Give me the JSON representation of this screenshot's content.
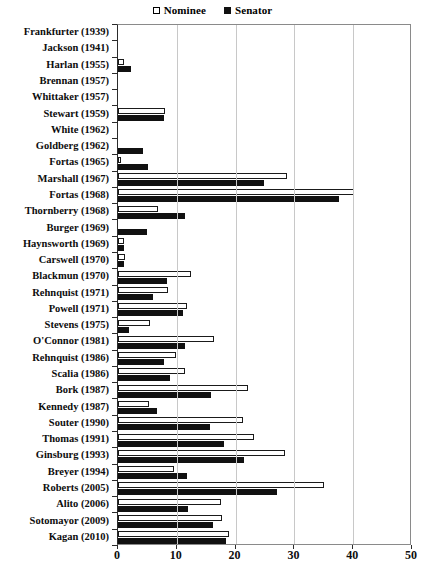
{
  "legend": {
    "position": "top-center",
    "entries": [
      {
        "label": "Nominee",
        "marker": "open-square-icon",
        "color": "#ffffff"
      },
      {
        "label": "Senator",
        "marker": "filled-square-icon",
        "color": "#111111"
      }
    ]
  },
  "chart_data": {
    "type": "bar",
    "orientation": "horizontal",
    "title": "",
    "subtitle": "",
    "xlabel": "",
    "ylabel": "",
    "xlim": [
      0,
      50
    ],
    "xticks": [
      0,
      10,
      20,
      30,
      40,
      50
    ],
    "xtick_labels": [
      "0",
      "10",
      "20",
      "30",
      "40",
      "50"
    ],
    "grid": "vertical",
    "legend_entries": [
      "Nominee",
      "Senator"
    ],
    "categories": [
      "Frankfurter (1939)",
      "Jackson (1941)",
      "Harlan (1955)",
      "Brennan (1957)",
      "Whittaker (1957)",
      "Stewart (1959)",
      "White (1962)",
      "Goldberg (1962)",
      "Fortas (1965)",
      "Marshall (1967)",
      "Fortas (1968)",
      "Thornberry (1968)",
      "Burger (1969)",
      "Haynsworth (1969)",
      "Carswell (1970)",
      "Blackmun (1970)",
      "Rehnquist (1971)",
      "Powell (1971)",
      "Stevens (1975)",
      "O'Connor (1981)",
      "Rehnquist (1986)",
      "Scalia (1986)",
      "Bork (1987)",
      "Kennedy (1987)",
      "Souter (1990)",
      "Thomas (1991)",
      "Ginsburg (1993)",
      "Breyer (1994)",
      "Roberts (2005)",
      "Alito (2006)",
      "Sotomayor (2009)",
      "Kagan (2010)"
    ],
    "series": [
      {
        "name": "Nominee",
        "style": "open",
        "values": [
          0,
          0,
          1.0,
          0,
          0,
          8.0,
          0,
          0,
          0.5,
          28.7,
          40.1,
          6.8,
          0,
          1.0,
          1.2,
          12.4,
          8.5,
          11.7,
          5.4,
          16.3,
          9.9,
          11.4,
          22.1,
          5.2,
          21.3,
          23.1,
          28.4,
          9.6,
          35.0,
          17.5,
          17.7,
          18.9
        ]
      },
      {
        "name": "Senator",
        "style": "filled",
        "values": [
          0,
          0,
          2.2,
          0,
          0,
          7.8,
          0,
          4.3,
          5.1,
          24.8,
          37.6,
          11.4,
          4.9,
          1.1,
          1.0,
          8.3,
          6.0,
          11.0,
          1.8,
          11.4,
          7.9,
          8.8,
          15.8,
          6.7,
          15.6,
          18.1,
          21.5,
          11.7,
          27.0,
          11.9,
          16.1,
          18.4
        ]
      }
    ]
  }
}
